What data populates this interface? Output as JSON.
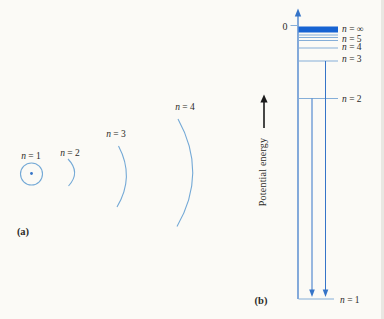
{
  "figure": {
    "panel_a": {
      "caption": "(a)",
      "orbits": [
        {
          "label": "n = 1"
        },
        {
          "label": "n = 2"
        },
        {
          "label": "n = 3"
        },
        {
          "label": "n = 4"
        }
      ]
    },
    "panel_b": {
      "caption": "(b)",
      "zero_label": "0",
      "axis_label": "Potential energy",
      "levels": [
        {
          "label": "n = ∞"
        },
        {
          "label": "n = 5"
        },
        {
          "label": "n = 4"
        },
        {
          "label": "n = 3"
        },
        {
          "label": "n = 2"
        },
        {
          "label": "n = 1"
        }
      ]
    },
    "colors": {
      "continuum_block": "#1763d2",
      "arrow_blue": "#3574c8",
      "level_line_blue": "#85aed8",
      "orbit_arc_blue": "#74a9d6",
      "text": "#2b2b28",
      "black_arrow": "#1a1a1a"
    }
  }
}
